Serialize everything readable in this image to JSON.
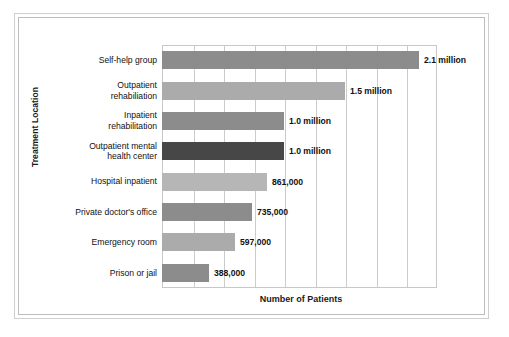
{
  "chart_data": {
    "type": "bar",
    "orientation": "horizontal",
    "title": "",
    "xlabel": "Number of Patients",
    "ylabel": "Treatment Location",
    "categories": [
      "Self-help group",
      "Outpatient rehabiliation",
      "Inpatient rehabilitation",
      "Outpatient mental health center",
      "Hospital inpatient",
      "Private doctor's office",
      "Emergency room",
      "Prison or jail"
    ],
    "values": [
      2100000,
      1500000,
      1000000,
      1000000,
      861000,
      735000,
      597000,
      388000
    ],
    "value_labels": [
      "2.1 million",
      "1.5 million",
      "1.0 million",
      "1.0 million",
      "861,000",
      "735,000",
      "597,000",
      "388,000"
    ],
    "bar_colors": [
      "#8c8c8c",
      "#ababab",
      "#8c8c8c",
      "#474747",
      "#b6b6b6",
      "#8c8c8c",
      "#ababab",
      "#8c8c8c"
    ],
    "xlim": [
      0,
      2250000
    ],
    "gridlines": [
      250000,
      500000,
      750000,
      1000000,
      1250000,
      1500000,
      1750000,
      2000000
    ],
    "grid": true,
    "legend": "none",
    "x_tick_labels": [],
    "y_label_lines": [
      [
        "Self-help group"
      ],
      [
        "Outpatient",
        "rehabiliation"
      ],
      [
        "Inpatient",
        "rehabilitation"
      ],
      [
        "Outpatient mental",
        "health center"
      ],
      [
        "Hospital inpatient"
      ],
      [
        "Private doctor's office"
      ],
      [
        "Emergency room"
      ],
      [
        "Prison or jail"
      ]
    ]
  },
  "figure": {
    "frame_color": "#cfcfcf",
    "plot_border_color": "#c8c8c8",
    "gridline_color": "#cccccc",
    "background": "#ffffff"
  }
}
